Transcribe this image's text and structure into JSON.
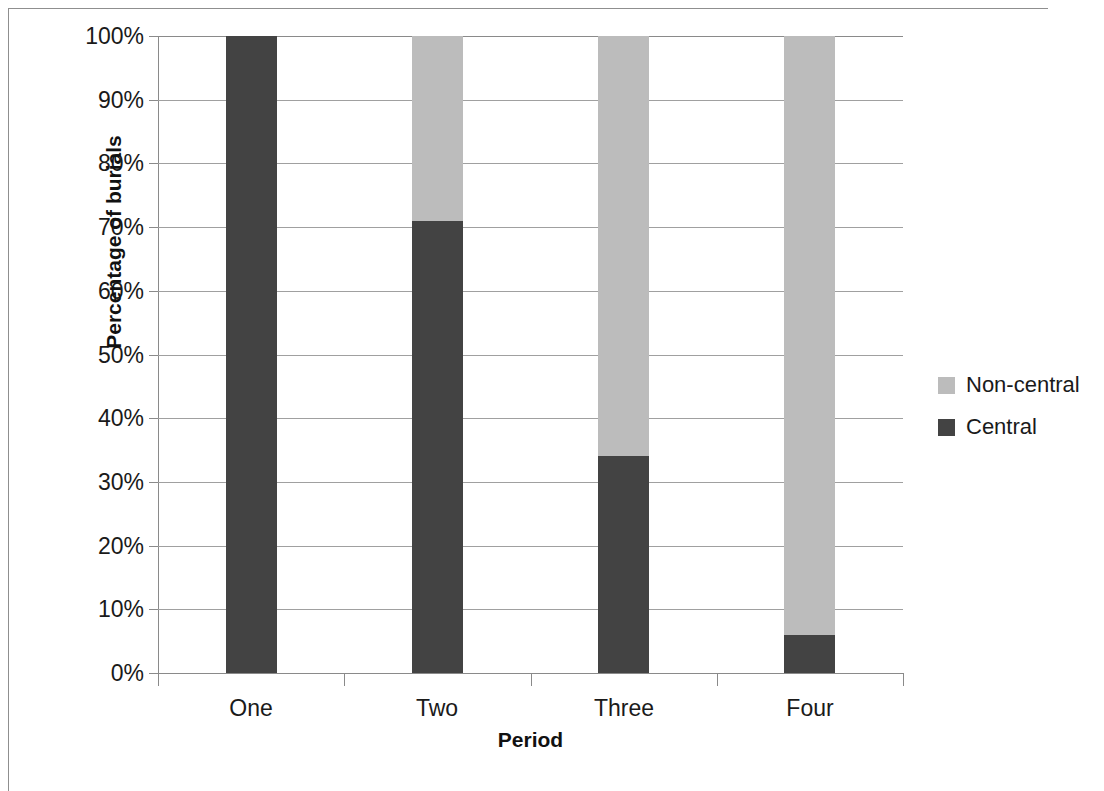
{
  "chart_data": {
    "type": "bar",
    "subtype": "stacked-100-percent",
    "title": "",
    "xlabel": "Period",
    "ylabel": "Percentage of burials",
    "categories": [
      "One",
      "Two",
      "Three",
      "Four"
    ],
    "series": [
      {
        "name": "Non-central",
        "color": "#bcbcbc",
        "values": [
          0,
          29,
          66,
          94
        ]
      },
      {
        "name": "Central",
        "color": "#434343",
        "values": [
          100,
          71,
          34,
          6
        ]
      }
    ],
    "stack_order_bottom_to_top": [
      "Central",
      "Non-central"
    ],
    "ylim": [
      0,
      100
    ],
    "ytick_values": [
      0,
      10,
      20,
      30,
      40,
      50,
      60,
      70,
      80,
      90,
      100
    ],
    "ytick_labels": [
      "0%",
      "10%",
      "20%",
      "30%",
      "40%",
      "50%",
      "60%",
      "70%",
      "80%",
      "90%",
      "100%"
    ],
    "grid": "horizontal",
    "legend_position": "right",
    "legend_entries": [
      "Non-central",
      "Central"
    ]
  },
  "axes": {
    "y_title": "Percentage of burials",
    "x_title": "Period"
  },
  "legend": {
    "items": [
      {
        "label": "Non-central",
        "color": "#bcbcbc"
      },
      {
        "label": "Central",
        "color": "#434343"
      }
    ]
  },
  "colors": {
    "central": "#434343",
    "non_central": "#bcbcbc",
    "grid": "#a0a0a0",
    "axis": "#8a8a8a",
    "frame": "#8f8f8f",
    "text": "#1a1a1a",
    "background": "#ffffff"
  }
}
